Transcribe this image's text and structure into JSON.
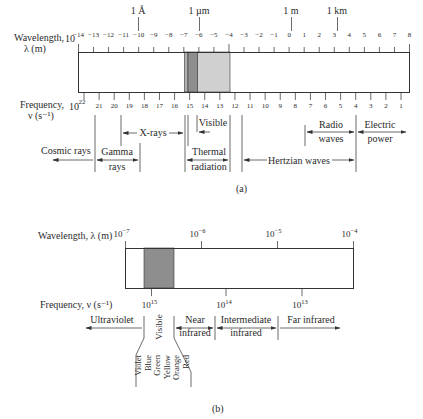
{
  "partA": {
    "wavelength_label_1": "Wavelength,",
    "wavelength_label_2": "λ (m)",
    "frequency_label_1": "Frequency,",
    "frequency_label_2": "ν (s⁻¹)",
    "landmarks": [
      "1 Å",
      "1 µm",
      "1 m",
      "1 km"
    ],
    "wavelength_exponents": [
      "−14",
      "−13",
      "−12",
      "−11",
      "−10",
      "−9",
      "−8",
      "−7",
      "−6",
      "−5",
      "−4",
      "−3",
      "−2",
      "−1",
      "0",
      "1",
      "2",
      "3",
      "4",
      "5",
      "6",
      "7",
      "8"
    ],
    "frequency_exponents": [
      "22",
      "21",
      "20",
      "19",
      "18",
      "17",
      "16",
      "15",
      "14",
      "13",
      "12",
      "11",
      "10",
      "9",
      "8",
      "7",
      "6",
      "5",
      "4",
      "3",
      "2",
      "1"
    ],
    "base": "10",
    "regions": {
      "cosmic": "Cosmic rays",
      "gamma_1": "Gamma",
      "gamma_2": "rays",
      "xrays": "X-rays",
      "visible": "Visible",
      "thermal_1": "Thermal",
      "thermal_2": "radiation",
      "hertzian": "Hertzian waves",
      "radio_1": "Radio",
      "radio_2": "waves",
      "electric_1": "Electric",
      "electric_2": "power"
    },
    "caption": "(a)"
  },
  "partB": {
    "wavelength_label": "Wavelength, λ (m)",
    "frequency_label": "Frequency, ν (s⁻¹)",
    "wavelength_ticks": [
      {
        "base": "10",
        "exp": "−7"
      },
      {
        "base": "10",
        "exp": "−6"
      },
      {
        "base": "10",
        "exp": "−5"
      },
      {
        "base": "10",
        "exp": "−4"
      }
    ],
    "frequency_ticks": [
      {
        "base": "10",
        "exp": "15"
      },
      {
        "base": "10",
        "exp": "14"
      },
      {
        "base": "10",
        "exp": "13"
      }
    ],
    "regions": {
      "ultraviolet": "Ultraviolet",
      "visible": "Visible",
      "near_1": "Near",
      "near_2": "infrared",
      "intermediate_1": "Intermediate",
      "intermediate_2": "infrared",
      "far": "Far infrared"
    },
    "colors": [
      "Violet",
      "Blue",
      "Green",
      "Yellow",
      "Orange",
      "Red"
    ],
    "caption": "(b)"
  },
  "style": {
    "visible_band_color": "#8e8e8e",
    "uv_band_color": "#b0b0b0",
    "ir_band_color": "#d0d0d0"
  }
}
